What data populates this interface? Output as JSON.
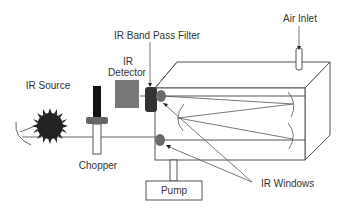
{
  "diagram": {
    "title": "",
    "type": "NDIR gas analyzer schematic",
    "labels": {
      "ir_source": "IR Source",
      "chopper": "Chopper",
      "ir_detector_line1": "IR",
      "ir_detector_line2": "Detector",
      "ir_band_pass_filter": "IR Band Pass Filter",
      "air_inlet": "Air Inlet",
      "pump": "Pump",
      "ir_windows": "IR Windows"
    },
    "components": [
      {
        "id": "ir-source",
        "label": "IR Source"
      },
      {
        "id": "chopper",
        "label": "Chopper"
      },
      {
        "id": "ir-detector",
        "label": "IR Detector"
      },
      {
        "id": "ir-band-pass-filter",
        "label": "IR Band Pass Filter"
      },
      {
        "id": "sample-cell",
        "label": ""
      },
      {
        "id": "air-inlet",
        "label": "Air Inlet"
      },
      {
        "id": "pump",
        "label": "Pump"
      },
      {
        "id": "ir-windows",
        "label": "IR Windows"
      }
    ],
    "colors": {
      "line": "#555555",
      "source": "#222222",
      "detector": "#777777",
      "filter": "#333333",
      "window": "#6a6a6a",
      "chopper_bar": "#111111",
      "chopper_collar": "#666666"
    }
  }
}
